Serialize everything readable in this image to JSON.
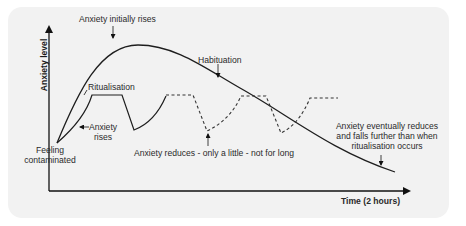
{
  "diagram": {
    "axes": {
      "y_label": "Anxiety level",
      "x_label": "Time (2 hours)"
    },
    "annotations": {
      "initial_rise": "Anxiety initially rises",
      "habituation": "Habituation",
      "ritualisation": "Ritualisation",
      "anxiety_rises_line1": "Anxiety",
      "anxiety_rises_line2": "rises",
      "feeling_line1": "Feeling",
      "feeling_line2": "contaminated",
      "reduces_little": "Anxiety reduces - only a little - not for long",
      "eventually_line1": "Anxiety  eventually reduces",
      "eventually_line2": "and falls further than when",
      "eventually_line3": "ritualisation occurs"
    },
    "curves": [
      {
        "name": "Habituation curve",
        "style": "solid",
        "description": "Rises from feeling contaminated, peaks, then falls steadily over 2 hours"
      },
      {
        "name": "Ritualisation cycle",
        "style": "solid then dashed",
        "description": "Repeated rise-plateau-dip cycles staying at a high level"
      }
    ],
    "colors": {
      "panel_bg": "#f2f2f2",
      "line": "#1e1e1e",
      "text": "#2a2a2a"
    }
  }
}
